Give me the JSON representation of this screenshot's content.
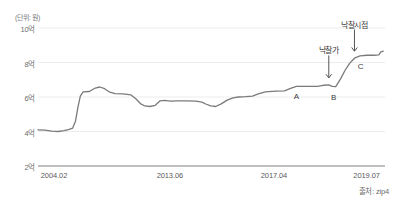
{
  "chart_data": {
    "type": "line",
    "title": "",
    "unit_label": "(단위: 원)",
    "source": "출처: zip4",
    "xlabel": "",
    "ylabel": "",
    "grid": true,
    "legend": "none",
    "ylim": [
      2,
      10
    ],
    "y_ticks": [
      {
        "value": 10,
        "label": "10억"
      },
      {
        "value": 8,
        "label": "8억"
      },
      {
        "value": 6,
        "label": "6억"
      },
      {
        "value": 4,
        "label": "4억"
      },
      {
        "value": 2,
        "label": "2억"
      }
    ],
    "x_ticks": [
      {
        "pos": 0.0,
        "label": "2004.02"
      },
      {
        "pos": 0.38,
        "label": "2013.06"
      },
      {
        "pos": 0.68,
        "label": "2017.04"
      },
      {
        "pos": 0.97,
        "label": "2019.07"
      }
    ],
    "series": [
      {
        "name": "거래가격",
        "color": "#7a7a7a",
        "points": [
          [
            0.0,
            4.1
          ],
          [
            0.02,
            4.08
          ],
          [
            0.04,
            4.02
          ],
          [
            0.058,
            4.0
          ],
          [
            0.075,
            4.05
          ],
          [
            0.09,
            4.12
          ],
          [
            0.1,
            4.2
          ],
          [
            0.108,
            4.6
          ],
          [
            0.115,
            5.4
          ],
          [
            0.122,
            6.05
          ],
          [
            0.13,
            6.3
          ],
          [
            0.148,
            6.32
          ],
          [
            0.165,
            6.52
          ],
          [
            0.178,
            6.58
          ],
          [
            0.192,
            6.48
          ],
          [
            0.205,
            6.3
          ],
          [
            0.222,
            6.2
          ],
          [
            0.245,
            6.18
          ],
          [
            0.268,
            6.12
          ],
          [
            0.282,
            5.9
          ],
          [
            0.295,
            5.62
          ],
          [
            0.308,
            5.48
          ],
          [
            0.322,
            5.45
          ],
          [
            0.338,
            5.52
          ],
          [
            0.352,
            5.78
          ],
          [
            0.365,
            5.8
          ],
          [
            0.382,
            5.76
          ],
          [
            0.4,
            5.78
          ],
          [
            0.43,
            5.78
          ],
          [
            0.455,
            5.76
          ],
          [
            0.472,
            5.7
          ],
          [
            0.485,
            5.58
          ],
          [
            0.498,
            5.48
          ],
          [
            0.512,
            5.45
          ],
          [
            0.528,
            5.6
          ],
          [
            0.545,
            5.82
          ],
          [
            0.562,
            5.95
          ],
          [
            0.578,
            6.0
          ],
          [
            0.598,
            6.02
          ],
          [
            0.618,
            6.05
          ],
          [
            0.635,
            6.18
          ],
          [
            0.655,
            6.3
          ],
          [
            0.685,
            6.34
          ],
          [
            0.71,
            6.36
          ],
          [
            0.73,
            6.52
          ],
          [
            0.745,
            6.62
          ],
          [
            0.775,
            6.62
          ],
          [
            0.805,
            6.62
          ],
          [
            0.822,
            6.68
          ],
          [
            0.838,
            6.7
          ],
          [
            0.848,
            6.62
          ],
          [
            0.858,
            6.6
          ],
          [
            0.872,
            7.05
          ],
          [
            0.885,
            7.55
          ],
          [
            0.898,
            7.95
          ],
          [
            0.912,
            8.25
          ],
          [
            0.928,
            8.38
          ],
          [
            0.948,
            8.42
          ],
          [
            0.968,
            8.42
          ],
          [
            0.982,
            8.44
          ],
          [
            0.988,
            8.62
          ],
          [
            0.995,
            8.66
          ]
        ]
      }
    ],
    "annotations": [
      {
        "id": "callout-nakchalga",
        "text": "낙찰가",
        "x": 0.838,
        "y": 6.7,
        "text_x": 0.838,
        "text_y": 9.05
      },
      {
        "id": "callout-nakchalsijeom",
        "text": "낙찰시점",
        "x": 0.912,
        "y": 8.25,
        "text_x": 0.912,
        "text_y": 10.55
      },
      {
        "id": "point-a",
        "text": "A",
        "x": 0.745,
        "y": 6.62
      },
      {
        "id": "point-b",
        "text": "B",
        "x": 0.852,
        "y": 6.6
      },
      {
        "id": "point-c",
        "text": "C",
        "x": 0.93,
        "y": 8.38
      }
    ]
  },
  "colors": {
    "line": "#7a7a7a",
    "axis": "#8a8a8a",
    "grid": "#ececec",
    "text": "#4a4a4a"
  }
}
